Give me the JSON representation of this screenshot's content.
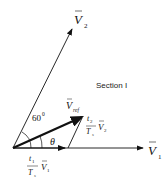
{
  "diagram": {
    "section_label": "Section I",
    "vectors": {
      "v1": {
        "symbol": "V",
        "subscript": "1"
      },
      "v2": {
        "symbol": "V",
        "subscript": "2"
      },
      "vref": {
        "symbol": "V",
        "subscript": "ref"
      }
    },
    "angle_60": "60",
    "angle_60_sup": "0",
    "theta": "θ",
    "comp1": {
      "num": "t",
      "num_sub": "1",
      "den": "T",
      "den_sub": "s",
      "vec": "V",
      "vec_sub": "1"
    },
    "comp2": {
      "num": "t",
      "num_sub": "2",
      "den": "T",
      "den_sub": "s",
      "vec": "V",
      "vec_sub": "2"
    },
    "colors": {
      "line": "#111111",
      "background": "#ffffff"
    }
  }
}
